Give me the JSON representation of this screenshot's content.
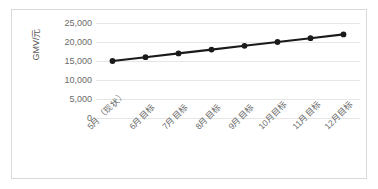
{
  "chart_data": {
    "type": "line",
    "title": "",
    "xlabel": "",
    "ylabel": "GMV/元",
    "categories": [
      "5月（现状）",
      "6月目标",
      "7月目标",
      "8月目标",
      "9月目标",
      "10月目标",
      "11月目标",
      "12月目标"
    ],
    "values": [
      15000,
      16000,
      17000,
      18000,
      19000,
      20000,
      21000,
      22000
    ],
    "series": [
      {
        "name": "GMV",
        "values": [
          15000,
          16000,
          17000,
          18000,
          19000,
          20000,
          21000,
          22000
        ]
      }
    ],
    "ylim": [
      0,
      25000
    ],
    "ytick_labels": [
      "0",
      "5,000",
      "10,000",
      "15,000",
      "20,000",
      "25,000"
    ],
    "ytick_values": [
      0,
      5000,
      10000,
      15000,
      20000,
      25000
    ],
    "grid": true,
    "legend": false,
    "legend_position": "none",
    "marker": "circle",
    "line_color": "#1a1a1a",
    "marker_color": "#1a1a1a",
    "grid_color": "#e6e6e6",
    "border_color": "#d9d9d9",
    "text_color": "#6b6b6b",
    "xtick_rotation": -45
  }
}
